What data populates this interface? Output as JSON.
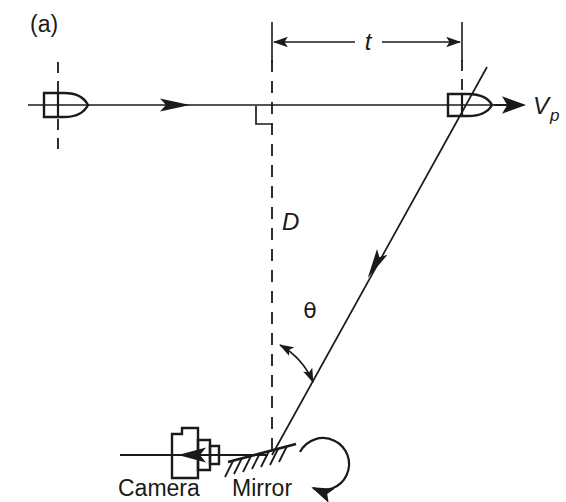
{
  "figure": {
    "panel_label": "(a)",
    "background_color": "#ffffff",
    "ink_color": "#1a1a1a",
    "width": 566,
    "height": 502
  },
  "labels": {
    "distance_t": "t",
    "distance_D": "D",
    "angle_theta": "θ",
    "velocity_symbol": "V",
    "velocity_subscript": "p",
    "camera": "Camera",
    "mirror": "Mirror"
  },
  "elements": {
    "projectile_start": "projectile-start",
    "projectile_end": "projectile-end",
    "trajectory": "horizontal-trajectory-line",
    "light_ray": "reflected-light-ray",
    "rotation": "mirror-rotation-arrow",
    "right_angle": "right-angle-marker"
  },
  "geometry": {
    "trajectory_y": 105,
    "trajectory_x_start": 28,
    "trajectory_x_end": 512,
    "bullet_left_x": 58,
    "bullet_right_x": 462,
    "vertical_dash_x": 272,
    "mirror_y": 455,
    "dimension_line_y": 42,
    "dimension_x_left": 272,
    "dimension_x_right": 462,
    "theta_degrees": 28
  }
}
